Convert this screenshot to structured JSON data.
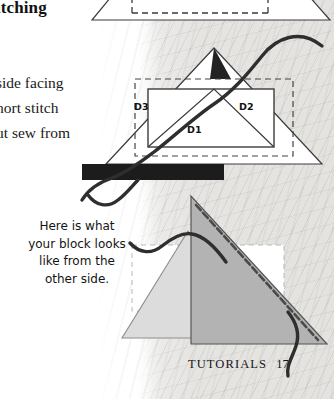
{
  "page": {
    "heading": "itching",
    "body_lines": [
      "side facing",
      "hort stitch",
      "ut sew from"
    ],
    "caption": "Here is what your block looks like from the other side.",
    "caption_lines": [
      "Here is what",
      "your block looks",
      "like from the",
      "other side."
    ],
    "footer": {
      "section": "TUTORIALS",
      "page_number": "17"
    }
  },
  "diagram_middle": {
    "labels": [
      {
        "id": "D3",
        "text": "D3",
        "x": 140,
        "y": 108
      },
      {
        "id": "D2",
        "text": "D2",
        "x": 245,
        "y": 108
      },
      {
        "id": "D1",
        "text": "D1",
        "x": 193,
        "y": 131
      }
    ]
  },
  "colors": {
    "ink": "#1a1a1a",
    "outline": "#3c3c3c",
    "dashed_guide": "#4a4a4a",
    "thread": "#2e2e2e",
    "dark_flap": "#232323",
    "dark_bar": "#1c1c1c",
    "triangle_light": "#dcdcdc",
    "triangle_dark": "#b3b3b3",
    "paper": "#e6e5e2",
    "page_background": "#ffffff"
  }
}
